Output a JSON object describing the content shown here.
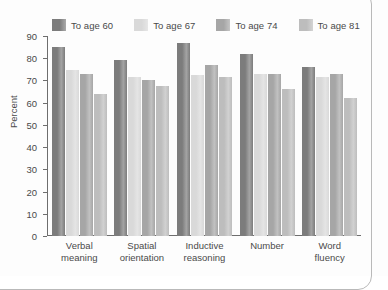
{
  "chart_data": {
    "type": "bar",
    "title": "",
    "xlabel": "",
    "ylabel": "Percent",
    "ylim": [
      0,
      90
    ],
    "yticks": [
      0,
      10,
      20,
      30,
      40,
      50,
      60,
      70,
      80,
      90
    ],
    "grid": false,
    "legend_position": "top",
    "categories": [
      "Verbal\nmeaning",
      "Spatial\norientation",
      "Inductive\nreasoning",
      "Number",
      "Word\nfluency"
    ],
    "category_lines": [
      [
        "Verbal",
        "meaning"
      ],
      [
        "Spatial",
        "orientation"
      ],
      [
        "Inductive",
        "reasoning"
      ],
      [
        "Number",
        ""
      ],
      [
        "Word",
        "fluency"
      ]
    ],
    "series": [
      {
        "name": "To age 60",
        "color": "#7c7c7c",
        "values": [
          85,
          79,
          87,
          82,
          76
        ]
      },
      {
        "name": "To age 67",
        "color": "#d9d9d9",
        "values": [
          74.5,
          71.5,
          72.5,
          73,
          71.5
        ]
      },
      {
        "name": "To age 74",
        "color": "#a6a6a6",
        "values": [
          73,
          70,
          77,
          73,
          73
        ]
      },
      {
        "name": "To age 81",
        "color": "#bdbdbd",
        "values": [
          64,
          67.5,
          71.5,
          66,
          62
        ]
      }
    ]
  }
}
